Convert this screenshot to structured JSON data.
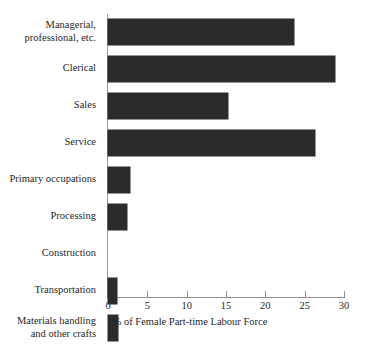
{
  "chart_data": {
    "type": "bar",
    "orientation": "horizontal",
    "title": "",
    "xlabel": "% of Female Part-time Labour Force",
    "ylabel": "",
    "xlim": [
      0,
      30
    ],
    "xticks": [
      0,
      5,
      10,
      15,
      20,
      25,
      30
    ],
    "xtick_labels": [
      "0",
      "5",
      "10",
      "15",
      "20",
      "25",
      "30"
    ],
    "grid": false,
    "legend": false,
    "bar_color": "#2b2b2b",
    "background_color": "#ffffff",
    "categories": [
      "Managerial, professional, etc.",
      "Clerical",
      "Sales",
      "Service",
      "Primary occupations",
      "Processing",
      "Construction",
      "Transportation",
      "Materials handling and other crafts"
    ],
    "category_lines": [
      [
        "Managerial,",
        "professional, etc."
      ],
      [
        "Clerical"
      ],
      [
        "Sales"
      ],
      [
        "Service"
      ],
      [
        "Primary occupations"
      ],
      [
        "Processing"
      ],
      [
        "Construction"
      ],
      [
        "Transportation"
      ],
      [
        "Materials handling",
        "and other crafts"
      ]
    ],
    "values": [
      23.6,
      28.8,
      15.2,
      26.3,
      2.8,
      2.4,
      0.0,
      1.1,
      1.3
    ]
  }
}
